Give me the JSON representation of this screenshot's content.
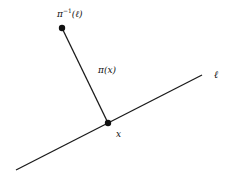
{
  "diagram": {
    "line_label": "ℓ",
    "point_label": "x",
    "segment_label": "π(x)",
    "preimage_label_base": "π",
    "preimage_label_sup": "−1",
    "preimage_label_arg": "(ℓ)",
    "colors": {
      "stroke": "#1a1a1a",
      "background": "#ffffff"
    },
    "geometry": {
      "line_start": [
        16,
        170
      ],
      "line_end": [
        202,
        75
      ],
      "point_x": [
        108,
        123
      ],
      "point_preimage": [
        62,
        28
      ]
    }
  }
}
